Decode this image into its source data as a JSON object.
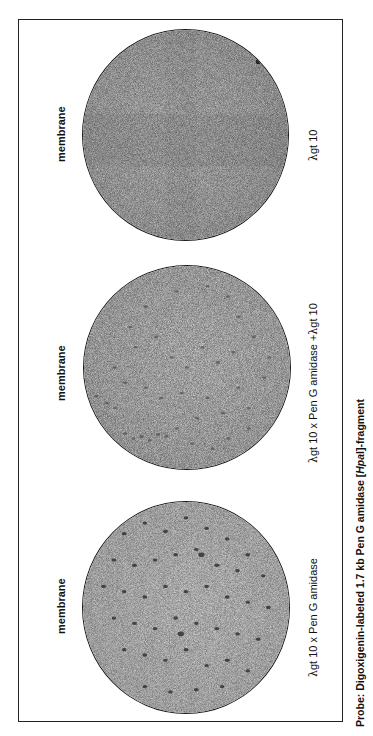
{
  "figure": {
    "panels": [
      {
        "id": "top",
        "membrane_label": "membrane",
        "sample_label_lambda": "λ",
        "sample_label": "gt 10",
        "spot_density": "none",
        "background_color": "#c8c8c8"
      },
      {
        "id": "middle",
        "membrane_label": "membrane",
        "sample_label_lambda": "λ",
        "sample_label": "gt 10 x  Pen G amidase  +",
        "sample_label_lambda2": "λ",
        "sample_label_suffix": "gt 10",
        "spot_density": "medium",
        "background_color": "#cfcfcf"
      },
      {
        "id": "bottom",
        "membrane_label": "membrane",
        "sample_label_lambda": "λ",
        "sample_label": "gt 10 x Pen G amidase",
        "spot_density": "high",
        "background_color": "#d6d6d6"
      }
    ],
    "caption": {
      "prefix": "Probe: Digoxigenin-labeled 1.7 kb Pen G amidase [",
      "italic": "Hpa",
      "suffix_roman": "I",
      "suffix": "]-fragment"
    }
  }
}
